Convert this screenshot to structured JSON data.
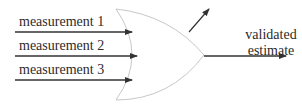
{
  "diagram": {
    "type": "fusion-gate",
    "inputs": [
      {
        "label": "measurement 1"
      },
      {
        "label": "measurement 2"
      },
      {
        "label": "measurement 3"
      }
    ],
    "outputs": {
      "main": {
        "line1": "validated",
        "line2": "estimate"
      },
      "side_arrow": {
        "label": ""
      }
    },
    "colors": {
      "arrow": "#333333",
      "gate_outline": "#c8c8c8",
      "text": "#2b2b2b"
    }
  }
}
